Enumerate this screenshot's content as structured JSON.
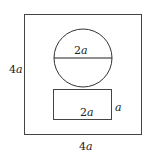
{
  "diagram": {
    "outer_square": {
      "side_label_left": "4",
      "side_label_left_var": "a",
      "side_label_bottom": "4",
      "side_label_bottom_var": "a"
    },
    "circle": {
      "diameter_label": "2",
      "diameter_label_var": "a"
    },
    "rectangle": {
      "width_label": "2",
      "width_label_var": "a",
      "height_label": "",
      "height_label_var": "a"
    },
    "stroke_color": "#333333"
  }
}
